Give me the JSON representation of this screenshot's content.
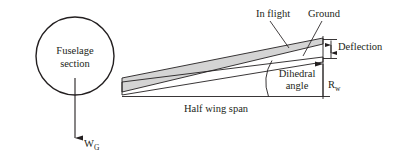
{
  "figure": {
    "background_color": "#ffffff",
    "line_color": "#231f20",
    "wing_fill_color": "#d4d4d4"
  },
  "labels": {
    "fuselage_line1": "Fuselage",
    "fuselage_line2": "section",
    "in_flight": "In flight",
    "ground": "Ground",
    "deflection": "Deflection",
    "dihedral_line1": "Dihedral",
    "dihedral_line2": "angle",
    "half_wing_span": "Half wing span",
    "rw_symbol": "R",
    "rw_subscript": "w",
    "wg_symbol": "W",
    "wg_subscript": "G"
  },
  "geometry": {
    "fuselage_center_x": 75,
    "fuselage_center_y": 56,
    "fuselage_radius": 39,
    "wing_root_x": 122,
    "wing_tip_x": 323,
    "baseline_y": 97,
    "ground_wing_tip_y": 58,
    "inflight_wing_tip_y": 38,
    "rw_value_label": "R_w",
    "weight_label": "W_G"
  },
  "icons": {
    "weight_arrow": "down-arrow-icon",
    "rw_arrow": "up-arrow-icon",
    "deflection_arrow": "double-arrow-vertical-icon"
  }
}
